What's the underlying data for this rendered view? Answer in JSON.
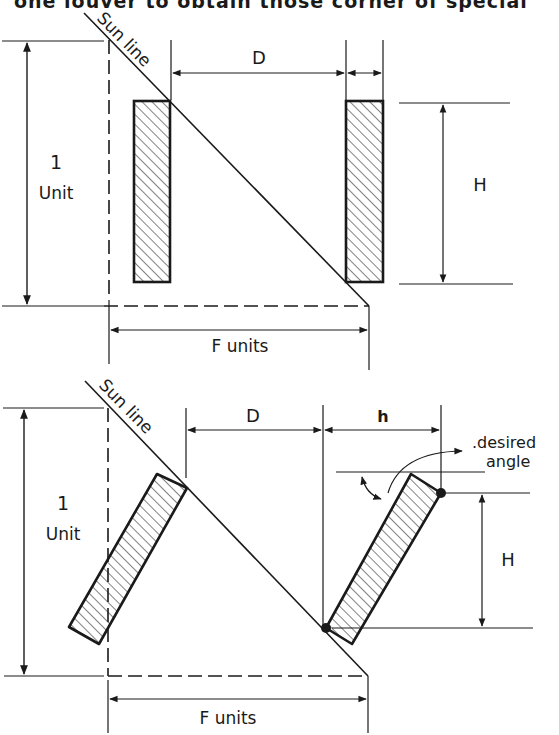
{
  "page": {
    "cropped_heading": "one louver to obtain those corner of special"
  },
  "colors": {
    "ink": "#1a1a1a",
    "paper": "#ffffff"
  },
  "diagrams": [
    {
      "id": "vertical-louvers",
      "sun_line_label": "Sun line",
      "height_label_1": "1",
      "height_label_2": "Unit",
      "spacing_label": "D",
      "slat_height_label": "H",
      "projection_label": "F units"
    },
    {
      "id": "tilted-louvers",
      "sun_line_label": "Sun line",
      "height_label_1": "1",
      "height_label_2": "Unit",
      "spacing_label": "D",
      "slat_width_label": "h",
      "slat_height_label": "H",
      "angle_label_1": ".desired",
      "angle_label_2": "angle",
      "projection_label": "F units"
    }
  ]
}
